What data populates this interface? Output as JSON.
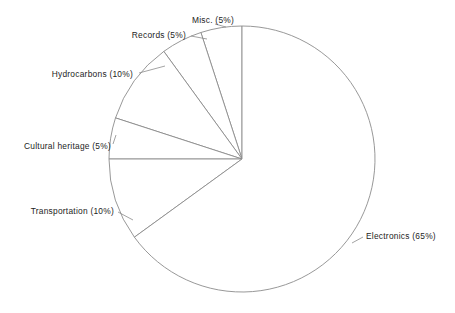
{
  "chart_data": {
    "type": "pie",
    "title": "",
    "subtitle": "",
    "xlabel": "",
    "ylabel": "",
    "legend_position": "none",
    "grid": false,
    "start_angle_deg": 90,
    "direction": "counterclockwise",
    "categories": [
      "Misc.",
      "Records",
      "Hydrocarbons",
      "Cultural heritage",
      "Transportation",
      "Electronics"
    ],
    "values": [
      5,
      10,
      5,
      5,
      65,
      10
    ],
    "slices": [
      {
        "name": "Misc.",
        "value": 5,
        "percent_text": "5%",
        "label": "Misc. (5%)",
        "label_x": 192,
        "label_y": 20,
        "label_anchor": "start",
        "leader": {
          "x1": 226,
          "y1": 27,
          "x2": 215,
          "y2": 24
        }
      },
      {
        "name": "Records",
        "value": 5,
        "percent_text": "5%",
        "label": "Records (5%)",
        "label_x": 186,
        "label_y": 35,
        "label_anchor": "end",
        "leader": {
          "x1": 207,
          "y1": 39,
          "x2": 191,
          "y2": 36
        }
      },
      {
        "name": "Hydrocarbons",
        "value": 10,
        "percent_text": "10%",
        "label": "Hydrocarbons (10%)",
        "label_x": 133,
        "label_y": 74,
        "label_anchor": "end",
        "leader": {
          "x1": 165,
          "y1": 66,
          "x2": 139,
          "y2": 73
        }
      },
      {
        "name": "Cultural heritage",
        "value": 5,
        "percent_text": "5%",
        "label": "Cultural heritage (5%)",
        "label_x": 111,
        "label_y": 146,
        "label_anchor": "end",
        "leader": {
          "x1": 116,
          "y1": 135,
          "x2": 113,
          "y2": 144
        }
      },
      {
        "name": "Transportation",
        "value": 10,
        "percent_text": "10%",
        "label": "Transportation (10%)",
        "label_x": 114,
        "label_y": 211,
        "label_anchor": "end",
        "leader": {
          "x1": 133,
          "y1": 220,
          "x2": 118,
          "y2": 212
        }
      },
      {
        "name": "Electronics",
        "value": 65,
        "percent_text": "65%",
        "label": "Electronics (65%)",
        "label_x": 366,
        "label_y": 236,
        "label_anchor": "start",
        "leader": {
          "x1": 352,
          "y1": 243,
          "x2": 363,
          "y2": 237
        }
      }
    ],
    "geometry": {
      "center_x": 242,
      "center_y": 159,
      "radius": 133
    },
    "style": {
      "background": "#ffffff",
      "slice_fill": "#ffffff",
      "stroke": "#8c8c8c",
      "text_color": "#1d1d1d"
    }
  }
}
